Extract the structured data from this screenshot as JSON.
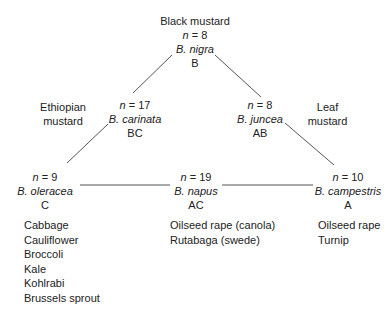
{
  "top": {
    "common_name": "Black mustard",
    "n": "8",
    "species": "B. nigra",
    "genome": "B"
  },
  "carinata": {
    "n": "17",
    "species": "B. carinata",
    "genome": "BC",
    "common_name_1": "Ethiopian",
    "common_name_2": "mustard"
  },
  "juncea": {
    "n": "8",
    "species": "B. juncea",
    "genome": "AB",
    "common_name_1": "Leaf",
    "common_name_2": "mustard"
  },
  "oleracea": {
    "n": "9",
    "species": "B. oleracea",
    "genome": "C",
    "crops": [
      "Cabbage",
      "Cauliflower",
      "Broccoli",
      "Kale",
      "Kohlrabi",
      "Brussels sprout"
    ]
  },
  "napus": {
    "n": "19",
    "species": "B. napus",
    "genome": "AC",
    "crops": [
      "Oilseed rape (canola)",
      "Rutabaga (swede)"
    ]
  },
  "campestris": {
    "n": "10",
    "species": "B. campestris",
    "genome": "A",
    "crops": [
      "Oilseed rape",
      "Turnip"
    ]
  },
  "n_prefix": "n",
  "eq": " = ",
  "colors": {
    "line": "#555555",
    "text": "#222222"
  }
}
